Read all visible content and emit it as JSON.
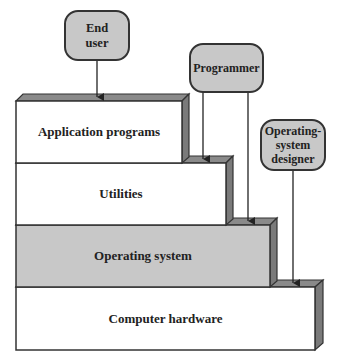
{
  "diagram": {
    "layers": [
      {
        "label": "Application programs",
        "fill": "#ffffff"
      },
      {
        "label": "Utilities",
        "fill": "#ffffff"
      },
      {
        "label": "Operating system",
        "fill": "#c8c8c8"
      },
      {
        "label": "Computer hardware",
        "fill": "#ffffff"
      }
    ],
    "actors": [
      {
        "label": "End user"
      },
      {
        "label": "Programmer"
      },
      {
        "label": "Operating-system designer"
      }
    ],
    "colors": {
      "side": "#7a7a7a",
      "stroke": "#333333",
      "actor_fill": "#c8c8c8"
    }
  }
}
